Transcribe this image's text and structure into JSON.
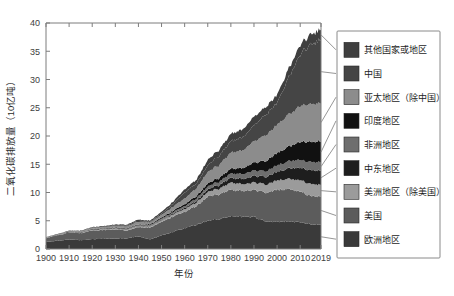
{
  "chart_data": {
    "type": "area",
    "stacked": true,
    "title": "",
    "xlabel": "年份",
    "ylabel": "二氧化碳排放量（10亿吨）",
    "xlim": [
      1900,
      2019
    ],
    "ylim": [
      0,
      40
    ],
    "yticks": [
      0,
      5,
      10,
      15,
      20,
      25,
      30,
      35,
      40
    ],
    "xticks": [
      1900,
      1910,
      1920,
      1930,
      1940,
      1950,
      1960,
      1970,
      1980,
      1990,
      2000,
      2010,
      2019
    ],
    "grid": false,
    "legend_position": "right",
    "x": [
      1900,
      1905,
      1910,
      1915,
      1920,
      1925,
      1930,
      1935,
      1940,
      1945,
      1950,
      1955,
      1960,
      1965,
      1970,
      1975,
      1980,
      1985,
      1990,
      1995,
      2000,
      2005,
      2010,
      2015,
      2019
    ],
    "series": [
      {
        "name": "欧洲地区",
        "color": "#3a3a3a",
        "values": [
          1.25,
          1.45,
          1.7,
          1.55,
          1.75,
          1.8,
          1.85,
          1.9,
          2.25,
          1.7,
          2.4,
          3.05,
          3.7,
          4.3,
          5.0,
          5.3,
          5.8,
          5.7,
          5.7,
          4.9,
          4.8,
          4.9,
          4.7,
          4.4,
          4.35
        ]
      },
      {
        "name": "美国",
        "color": "#5c5c5c",
        "values": [
          0.66,
          0.95,
          1.2,
          1.25,
          1.55,
          1.55,
          1.6,
          1.35,
          1.65,
          2.1,
          2.4,
          2.7,
          2.9,
          3.3,
          4.3,
          4.4,
          4.7,
          4.5,
          4.85,
          5.1,
          5.7,
          5.75,
          5.35,
          5.0,
          4.95
        ]
      },
      {
        "name": "美洲地区（除美国）",
        "color": "#9b9b9b",
        "values": [
          0.03,
          0.04,
          0.06,
          0.07,
          0.09,
          0.11,
          0.13,
          0.14,
          0.17,
          0.21,
          0.28,
          0.38,
          0.5,
          0.62,
          0.82,
          1.0,
          1.25,
          1.2,
          1.3,
          1.45,
          1.65,
          1.8,
          2.0,
          2.1,
          2.05
        ]
      },
      {
        "name": "中东地区",
        "color": "#1e1e1e",
        "values": [
          0.01,
          0.01,
          0.01,
          0.01,
          0.02,
          0.02,
          0.03,
          0.04,
          0.05,
          0.07,
          0.1,
          0.15,
          0.22,
          0.3,
          0.45,
          0.62,
          0.85,
          0.95,
          1.15,
          1.35,
          1.55,
          1.85,
          2.2,
          2.45,
          2.5
        ]
      },
      {
        "name": "非洲地区",
        "color": "#6e6e6e",
        "values": [
          0.02,
          0.03,
          0.04,
          0.05,
          0.06,
          0.08,
          0.1,
          0.11,
          0.13,
          0.15,
          0.2,
          0.25,
          0.32,
          0.4,
          0.52,
          0.62,
          0.78,
          0.85,
          0.95,
          1.0,
          1.1,
          1.25,
          1.4,
          1.45,
          1.45
        ]
      },
      {
        "name": "印度地区",
        "color": "#111111",
        "values": [
          0.03,
          0.04,
          0.05,
          0.06,
          0.08,
          0.09,
          0.1,
          0.11,
          0.13,
          0.15,
          0.2,
          0.25,
          0.33,
          0.42,
          0.55,
          0.65,
          0.85,
          1.05,
          1.4,
          1.8,
          2.2,
          2.6,
          3.2,
          3.6,
          3.7
        ]
      },
      {
        "name": "亚太地区（除中国）",
        "color": "#8c8c8c",
        "values": [
          0.05,
          0.07,
          0.1,
          0.13,
          0.17,
          0.22,
          0.28,
          0.35,
          0.45,
          0.3,
          0.45,
          0.7,
          1.0,
          1.35,
          2.0,
          2.3,
          2.85,
          3.1,
          3.8,
          4.6,
          5.0,
          5.6,
          6.3,
          6.7,
          6.8
        ]
      },
      {
        "name": "中国",
        "color": "#454545",
        "values": [
          0.02,
          0.03,
          0.04,
          0.05,
          0.07,
          0.09,
          0.12,
          0.15,
          0.2,
          0.12,
          0.25,
          0.5,
          1.1,
          0.85,
          1.2,
          1.6,
          2.0,
          2.3,
          2.85,
          3.6,
          3.9,
          6.5,
          9.2,
          10.6,
          11.3
        ]
      },
      {
        "name": "其他国家或地区",
        "color": "#3f3f3f",
        "values": [
          0.04,
          0.05,
          0.07,
          0.08,
          0.1,
          0.12,
          0.14,
          0.16,
          0.2,
          0.22,
          0.3,
          0.4,
          0.55,
          0.7,
          0.95,
          1.1,
          1.3,
          1.4,
          1.55,
          1.4,
          1.45,
          1.55,
          1.7,
          1.8,
          1.8
        ]
      }
    ],
    "legend_entries": [
      {
        "label": "其他国家或地区",
        "color": "#3f3f3f"
      },
      {
        "label": "中国",
        "color": "#454545"
      },
      {
        "label": "亚太地区（除中国）",
        "color": "#8c8c8c"
      },
      {
        "label": "印度地区",
        "color": "#111111"
      },
      {
        "label": "非洲地区",
        "color": "#6e6e6e"
      },
      {
        "label": "中东地区",
        "color": "#1e1e1e"
      },
      {
        "label": "美洲地区（除美国）",
        "color": "#9b9b9b"
      },
      {
        "label": "美国",
        "color": "#5c5c5c"
      },
      {
        "label": "欧洲地区",
        "color": "#3a3a3a"
      }
    ]
  }
}
